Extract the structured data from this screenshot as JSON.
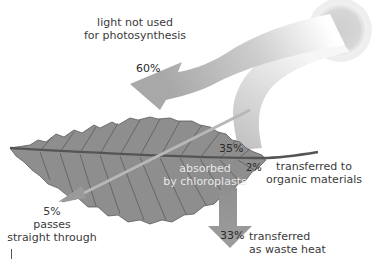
{
  "diagram": {
    "colors": {
      "arrow_gray": "#9a9a9a",
      "leaf_fill": "#8c8c8c",
      "leaf_vein": "#4a4a4a",
      "sun": "#d4d4d4",
      "text": "#3a3a3a",
      "text_on_leaf": "#e8e8e8"
    },
    "labels": {
      "not_used": {
        "line1": "light not used",
        "line2": "for photosynthesis",
        "percent": "60%"
      },
      "absorbed": {
        "line1": "absorbed",
        "line2": "by chloroplasts",
        "percent": "35%"
      },
      "organic": {
        "line1": "transferred to",
        "line2": "organic materials",
        "percent": "2%"
      },
      "waste_heat": {
        "line1": "transferred",
        "line2": "as waste heat",
        "percent": "33%"
      },
      "passes_through": {
        "percent": "5%",
        "line1": "passes",
        "line2": "straight through"
      }
    }
  }
}
